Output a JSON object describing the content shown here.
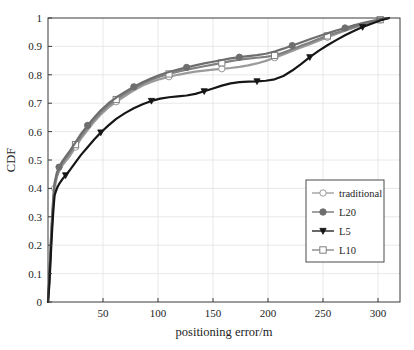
{
  "chart_data": {
    "type": "line",
    "title": "",
    "subtitle": "",
    "xlabel": "positioning error/m",
    "ylabel": "CDF",
    "xlim": [
      0,
      320
    ],
    "ylim": [
      0,
      1
    ],
    "xticks": [
      0,
      50,
      100,
      150,
      200,
      250,
      300
    ],
    "xtick_labels": [
      "",
      "50",
      "100",
      "150",
      "200",
      "250",
      "300"
    ],
    "yticks": [
      0,
      0.1,
      0.2,
      0.3,
      0.4,
      0.5,
      0.6,
      0.7,
      0.8,
      0.9,
      1
    ],
    "ytick_labels": [
      "0",
      "0.1",
      "0.2",
      "0.3",
      "0.4",
      "0.5",
      "0.6",
      "0.7",
      "0.8",
      "0.9",
      "1"
    ],
    "grid": true,
    "legend_position": "lower right",
    "series": [
      {
        "name": "traditional",
        "marker": "circle-open",
        "color": "#9a9a9a",
        "line_color": "#9a9a9a",
        "x": [
          0,
          1,
          2,
          3,
          4,
          5,
          6,
          8,
          10,
          13,
          16,
          20,
          25,
          30,
          36,
          42,
          48,
          55,
          62,
          70,
          78,
          86,
          94,
          102,
          110,
          118,
          126,
          134,
          142,
          150,
          158,
          166,
          174,
          182,
          190,
          198,
          206,
          214,
          222,
          230,
          238,
          246,
          254,
          262,
          270,
          278,
          286,
          294,
          302,
          310
        ],
        "y": [
          0,
          0.06,
          0.14,
          0.22,
          0.29,
          0.35,
          0.4,
          0.44,
          0.46,
          0.48,
          0.495,
          0.515,
          0.545,
          0.575,
          0.605,
          0.635,
          0.66,
          0.685,
          0.705,
          0.725,
          0.745,
          0.762,
          0.775,
          0.785,
          0.793,
          0.8,
          0.806,
          0.811,
          0.815,
          0.818,
          0.821,
          0.824,
          0.828,
          0.833,
          0.84,
          0.849,
          0.86,
          0.872,
          0.884,
          0.896,
          0.908,
          0.92,
          0.932,
          0.944,
          0.955,
          0.966,
          0.976,
          0.985,
          0.993,
          1.0
        ]
      },
      {
        "name": "L20",
        "marker": "circle-filled",
        "color": "#6e6e6e",
        "line_color": "#6e6e6e",
        "x": [
          0,
          1,
          2,
          3,
          4,
          5,
          6,
          8,
          10,
          13,
          16,
          20,
          25,
          30,
          36,
          42,
          48,
          55,
          62,
          70,
          78,
          86,
          94,
          102,
          110,
          118,
          126,
          134,
          142,
          150,
          158,
          166,
          174,
          182,
          190,
          198,
          206,
          214,
          222,
          230,
          238,
          246,
          254,
          262,
          270,
          278,
          286,
          294,
          302,
          310
        ],
        "y": [
          0,
          0.07,
          0.16,
          0.25,
          0.32,
          0.38,
          0.42,
          0.455,
          0.475,
          0.495,
          0.512,
          0.533,
          0.562,
          0.592,
          0.622,
          0.65,
          0.675,
          0.7,
          0.72,
          0.74,
          0.758,
          0.774,
          0.788,
          0.8,
          0.81,
          0.818,
          0.826,
          0.833,
          0.84,
          0.846,
          0.852,
          0.858,
          0.862,
          0.866,
          0.869,
          0.874,
          0.882,
          0.892,
          0.903,
          0.914,
          0.925,
          0.936,
          0.946,
          0.956,
          0.965,
          0.974,
          0.982,
          0.989,
          0.995,
          1.0
        ]
      },
      {
        "name": "L5",
        "marker": "triangle-down",
        "color": "#161616",
        "line_color": "#161616",
        "x": [
          0,
          1,
          2,
          3,
          4,
          5,
          6,
          8,
          10,
          13,
          16,
          20,
          25,
          30,
          36,
          42,
          48,
          55,
          62,
          70,
          78,
          86,
          94,
          102,
          110,
          118,
          126,
          134,
          142,
          150,
          158,
          166,
          174,
          182,
          190,
          198,
          206,
          214,
          222,
          230,
          238,
          246,
          254,
          262,
          270,
          278,
          286,
          294,
          302,
          310
        ],
        "y": [
          0,
          0.05,
          0.12,
          0.2,
          0.27,
          0.33,
          0.375,
          0.4,
          0.415,
          0.432,
          0.446,
          0.465,
          0.492,
          0.518,
          0.545,
          0.572,
          0.597,
          0.622,
          0.645,
          0.665,
          0.682,
          0.696,
          0.708,
          0.716,
          0.721,
          0.724,
          0.727,
          0.733,
          0.742,
          0.752,
          0.762,
          0.77,
          0.774,
          0.776,
          0.777,
          0.779,
          0.784,
          0.796,
          0.815,
          0.838,
          0.862,
          0.884,
          0.904,
          0.922,
          0.939,
          0.954,
          0.968,
          0.98,
          0.991,
          1.0
        ]
      },
      {
        "name": "L10",
        "marker": "square-open",
        "color": "#808080",
        "line_color": "#808080",
        "x": [
          0,
          1,
          2,
          3,
          4,
          5,
          6,
          8,
          10,
          13,
          16,
          20,
          25,
          30,
          36,
          42,
          48,
          55,
          62,
          70,
          78,
          86,
          94,
          102,
          110,
          118,
          126,
          134,
          142,
          150,
          158,
          166,
          174,
          182,
          190,
          198,
          206,
          214,
          222,
          230,
          238,
          246,
          254,
          262,
          270,
          278,
          286,
          294,
          302,
          310
        ],
        "y": [
          0,
          0.065,
          0.15,
          0.235,
          0.305,
          0.36,
          0.41,
          0.445,
          0.467,
          0.488,
          0.505,
          0.525,
          0.554,
          0.584,
          0.614,
          0.643,
          0.668,
          0.693,
          0.713,
          0.733,
          0.752,
          0.769,
          0.783,
          0.794,
          0.803,
          0.811,
          0.818,
          0.824,
          0.83,
          0.836,
          0.842,
          0.848,
          0.853,
          0.857,
          0.86,
          0.863,
          0.868,
          0.878,
          0.89,
          0.902,
          0.914,
          0.926,
          0.937,
          0.948,
          0.958,
          0.968,
          0.977,
          0.986,
          0.994,
          1.0
        ]
      }
    ],
    "legend_entries": [
      {
        "label": "traditional",
        "marker": "circle-open",
        "color": "#9a9a9a"
      },
      {
        "label": "L20",
        "marker": "circle-filled",
        "color": "#6e6e6e"
      },
      {
        "label": "L5",
        "marker": "triangle-down",
        "color": "#161616"
      },
      {
        "label": "L10",
        "marker": "square-open",
        "color": "#808080"
      }
    ],
    "style": {
      "axis_color": "#3a3a3a",
      "grid_color": "#e2e2e2",
      "background": "#ffffff"
    }
  }
}
